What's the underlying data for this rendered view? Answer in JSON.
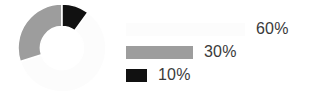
{
  "chart_data": {
    "type": "pie",
    "title": "",
    "subtitle": "",
    "xlabel": "",
    "ylabel": "",
    "donut": true,
    "inner_radius_ratio": 0.49,
    "start_angle_deg": 0,
    "direction": "clockwise",
    "legend_position": "right",
    "grid": false,
    "categories": [
      "60%",
      "30%",
      "10%"
    ],
    "values": [
      60,
      30,
      10
    ],
    "labels": [
      "60%",
      "30%",
      "10%"
    ],
    "colors": [
      "#fcfcfc",
      "#9d9d9d",
      "#111111"
    ],
    "slices": [
      {
        "label": "60%",
        "value": 60,
        "color": "#fcfcfc",
        "start_angle_deg": 36,
        "end_angle_deg": 252,
        "legend_bar_width_px": 119
      },
      {
        "label": "30%",
        "value": 30,
        "color": "#9d9d9d",
        "start_angle_deg": 252,
        "end_angle_deg": 360,
        "legend_bar_width_px": 67
      },
      {
        "label": "10%",
        "value": 10,
        "color": "#111111",
        "start_angle_deg": 0,
        "end_angle_deg": 36,
        "legend_bar_width_px": 21
      }
    ]
  },
  "chart": {
    "background_color": "#ffffff",
    "slice_gap_color": "#ffffff",
    "slice_gap_width": 1.6,
    "center_x": 45,
    "center_y": 45,
    "outer_radius": 44,
    "inner_radius": 21.5
  },
  "legend": {
    "text_color": "#3a3a3a",
    "items": [
      {
        "label": "60%",
        "color": "#fcfcfc",
        "bar_width": 119
      },
      {
        "label": "30%",
        "color": "#9d9d9d",
        "bar_width": 67
      },
      {
        "label": "10%",
        "color": "#111111",
        "bar_width": 21
      }
    ]
  }
}
